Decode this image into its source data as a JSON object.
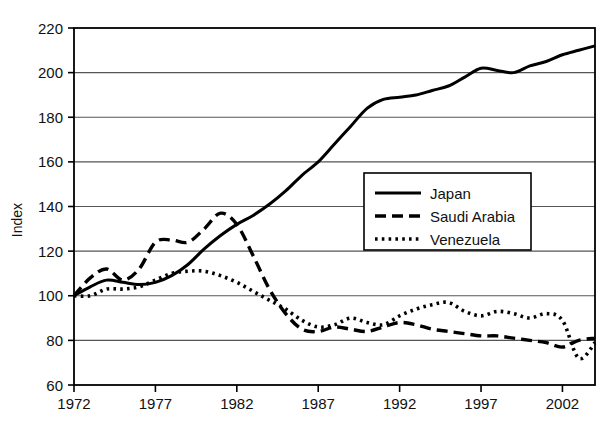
{
  "chart_data": {
    "type": "line",
    "title": "",
    "xlabel": "",
    "ylabel": "Index",
    "xlim": [
      1972,
      2004
    ],
    "ylim": [
      60,
      220
    ],
    "grid": true,
    "grid_axis": "y",
    "legend_position": "center-right-inside",
    "xticks": [
      "1972",
      "1977",
      "1982",
      "1987",
      "1992",
      "1997",
      "2002"
    ],
    "xtick_values": [
      1972,
      1977,
      1982,
      1987,
      1992,
      1997,
      2002
    ],
    "yticks": [
      "60",
      "80",
      "100",
      "120",
      "140",
      "160",
      "180",
      "200",
      "220"
    ],
    "ytick_values": [
      60,
      80,
      100,
      120,
      140,
      160,
      180,
      200,
      220
    ],
    "x": [
      1972,
      1973,
      1974,
      1975,
      1976,
      1977,
      1978,
      1979,
      1980,
      1981,
      1982,
      1983,
      1984,
      1985,
      1986,
      1987,
      1988,
      1989,
      1990,
      1991,
      1992,
      1993,
      1994,
      1995,
      1996,
      1997,
      1998,
      1999,
      2000,
      2001,
      2002,
      2003,
      2004
    ],
    "series": [
      {
        "name": "Japan",
        "style": "solid",
        "color": "#000000",
        "values": [
          100,
          104,
          107,
          106,
          105,
          106,
          109,
          114,
          121,
          127,
          132,
          136,
          141,
          147,
          154,
          160,
          168,
          176,
          184,
          188,
          189,
          190,
          192,
          194,
          198,
          202,
          201,
          200,
          203,
          205,
          208,
          210,
          212
        ]
      },
      {
        "name": "Saudi Arabia",
        "style": "dashed",
        "color": "#000000",
        "values": [
          100,
          108,
          112,
          107,
          112,
          124,
          125,
          124,
          130,
          137,
          132,
          118,
          103,
          92,
          85,
          84,
          86,
          85,
          84,
          86,
          88,
          87,
          85,
          84,
          83,
          82,
          82,
          81,
          80,
          79,
          77,
          80,
          81
        ]
      },
      {
        "name": "Venezuela",
        "style": "dotted",
        "color": "#000000",
        "values": [
          100,
          100,
          103,
          103,
          104,
          107,
          110,
          111,
          111,
          109,
          106,
          102,
          98,
          94,
          89,
          86,
          87,
          90,
          88,
          87,
          91,
          94,
          96,
          97,
          93,
          91,
          93,
          92,
          90,
          92,
          89,
          72,
          79
        ]
      }
    ],
    "legend": [
      {
        "label": "Japan",
        "style": "solid"
      },
      {
        "label": "Saudi Arabia",
        "style": "dashed"
      },
      {
        "label": "Venezuela",
        "style": "dotted"
      }
    ]
  },
  "axes": {
    "y_title": "Index"
  }
}
